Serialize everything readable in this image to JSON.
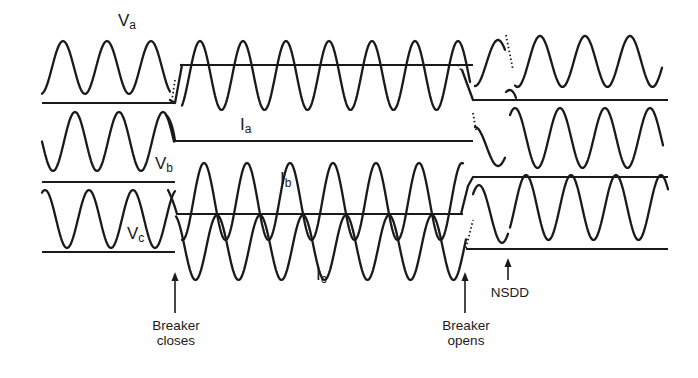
{
  "figure": {
    "signal_labels": [
      {
        "id": "va",
        "main": "V",
        "sub": "a",
        "x": 118,
        "y": 12
      },
      {
        "id": "ia",
        "main": "I",
        "sub": "a",
        "x": 240,
        "y": 116
      },
      {
        "id": "vb",
        "main": "V",
        "sub": "b",
        "x": 155,
        "y": 155
      },
      {
        "id": "ib",
        "main": "I",
        "sub": "b",
        "x": 280,
        "y": 170
      },
      {
        "id": "vc",
        "main": "V",
        "sub": "c",
        "x": 127,
        "y": 225
      },
      {
        "id": "ic",
        "main": "I",
        "sub": "c",
        "x": 316,
        "y": 266
      }
    ],
    "annotations": [
      {
        "id": "breaker-closes",
        "lines": [
          "Breaker",
          "closes"
        ],
        "arrow_x": 175,
        "arrow_top": 272,
        "arrow_bottom": 313,
        "text_x": 140,
        "text_y": 318,
        "width": 72
      },
      {
        "id": "breaker-opens",
        "lines": [
          "Breaker",
          "opens"
        ],
        "arrow_x": 465,
        "arrow_top": 272,
        "arrow_bottom": 313,
        "text_x": 430,
        "text_y": 318,
        "width": 72
      },
      {
        "id": "nsdd",
        "lines": [
          "NSDD"
        ],
        "arrow_x": 508,
        "arrow_top": 258,
        "arrow_bottom": 280,
        "text_x": 488,
        "text_y": 285,
        "width": 44
      }
    ]
  },
  "chart_data": {
    "type": "line",
    "title": "",
    "events": [
      {
        "label": "Breaker closes",
        "x": 175
      },
      {
        "label": "Breaker opens",
        "x": 465
      },
      {
        "label": "NSDD",
        "x": 508
      }
    ],
    "reference_lines": [
      {
        "name": "Va-ref-pre",
        "y": 103,
        "x": [
          42,
          175
        ]
      },
      {
        "name": "Ia-ref",
        "y": 65,
        "x": [
          180,
          473
        ]
      },
      {
        "name": "Va-ref-post",
        "y": 100,
        "x": [
          473,
          668
        ]
      },
      {
        "name": "Vb-ref-mid",
        "y": 141,
        "x": [
          175,
          473
        ]
      },
      {
        "name": "Vc-ref-top-pre",
        "y": 182,
        "x": [
          42,
          175
        ]
      },
      {
        "name": "Ib-ref",
        "y": 214,
        "x": [
          178,
          463
        ]
      },
      {
        "name": "Vc-ref-top-post",
        "y": 177,
        "x": [
          473,
          668
        ]
      },
      {
        "name": "Vc-ref-bottom-pre",
        "y": 252,
        "x": [
          42,
          175
        ]
      },
      {
        "name": "Vc-ref-bottom-post",
        "y": 249,
        "x": [
          466,
          668
        ]
      }
    ],
    "series": [
      {
        "name": "Va (pre)",
        "x0": 42,
        "x1": 170,
        "period": 44,
        "phase_x": 63,
        "top": 41,
        "bottom": 94
      },
      {
        "name": "Ia",
        "x0": 182,
        "x1": 470,
        "period": 43,
        "phase_x": 200,
        "top": 41,
        "bottom": 110
      },
      {
        "name": "Va (post)",
        "x0": 475,
        "x1": 505,
        "period": 46,
        "phase_x": 498,
        "top": 40,
        "bottom": 86
      },
      {
        "name": "Va (post NSDD)",
        "x0": 515,
        "x1": 662,
        "period": 45,
        "phase_x": 540,
        "top": 36,
        "bottom": 87
      },
      {
        "name": "Vb (pre)",
        "x0": 42,
        "x1": 174,
        "period": 44,
        "phase_x": 75,
        "top": 112,
        "bottom": 171
      },
      {
        "name": "Vb (post)",
        "x0": 475,
        "x1": 505,
        "period": 46,
        "phase_x": 475,
        "top": 127,
        "bottom": 166
      },
      {
        "name": "Vb (post NSDD)",
        "x0": 510,
        "x1": 663,
        "period": 45,
        "phase_x": 515,
        "top": 108,
        "bottom": 168
      },
      {
        "name": "Vc (pre)",
        "x0": 42,
        "x1": 175,
        "period": 44,
        "phase_x": 89,
        "top": 190,
        "bottom": 248
      },
      {
        "name": "Ib",
        "x0": 182,
        "x1": 463,
        "period": 43,
        "phase_x": 376,
        "top": 163,
        "bottom": 240
      },
      {
        "name": "Ic",
        "x0": 176,
        "x1": 466,
        "period": 43,
        "phase_x": 217,
        "top": 215,
        "bottom": 280
      },
      {
        "name": "Vc (post)",
        "x0": 473,
        "x1": 508,
        "period": 46,
        "phase_x": 479,
        "top": 185,
        "bottom": 243
      },
      {
        "name": "Vc (post NSDD)",
        "x0": 510,
        "x1": 668,
        "period": 45,
        "phase_x": 526,
        "top": 175,
        "bottom": 240
      }
    ]
  }
}
